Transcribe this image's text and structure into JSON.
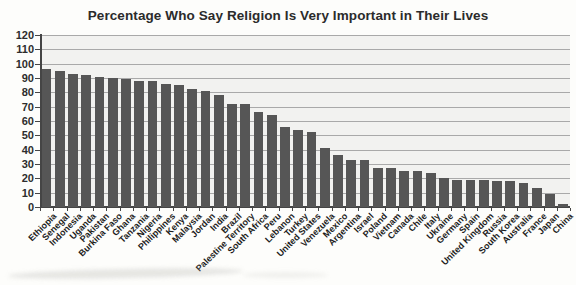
{
  "chart_data": {
    "type": "bar",
    "title": "Percentage Who Say Religion Is Very Important in Their Lives",
    "xlabel": "",
    "ylabel": "",
    "ylim": [
      0,
      120
    ],
    "yticks": [
      0,
      10,
      20,
      30,
      40,
      50,
      60,
      70,
      80,
      90,
      100,
      110,
      120
    ],
    "grid": true,
    "legend": "none",
    "bar_color": "#565656",
    "gridline_color": "#a9a9a9",
    "axis_color": "#454545",
    "categories": [
      "Ethiopia",
      "Senegal",
      "Indonesia",
      "Uganda",
      "Pakistan",
      "Burkina Faso",
      "Ghana",
      "Tanzania",
      "Nigeria",
      "Philippines",
      "Kenya",
      "Malaysia",
      "Jordan",
      "India",
      "Brazil",
      "Palestine Territory",
      "South Africa",
      "Peru",
      "Lebanon",
      "Turkey",
      "United States",
      "Venezuela",
      "Mexico",
      "Argentina",
      "Israel",
      "Poland",
      "Vietnam",
      "Canada",
      "Chile",
      "Italy",
      "Ukraine",
      "Germany",
      "Spain",
      "United Kingdom",
      "Russia",
      "South Korea",
      "Australia",
      "France",
      "Japan",
      "China"
    ],
    "values": [
      96,
      95,
      93,
      92,
      91,
      90,
      89,
      88,
      88,
      86,
      85,
      82,
      81,
      78,
      72,
      72,
      66,
      64,
      56,
      54,
      52,
      41,
      36,
      33,
      33,
      27,
      27,
      25,
      25,
      24,
      20,
      19,
      19,
      19,
      18,
      18,
      17,
      13,
      9,
      2
    ]
  }
}
